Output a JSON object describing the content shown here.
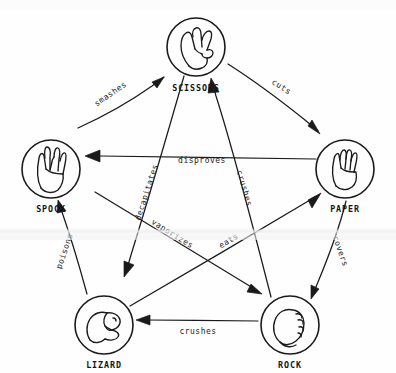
{
  "diagram": {
    "style": "hand-drawn sketch, black ink on white paper",
    "background_color": "#fefefe",
    "ink_color": "#1a1a1a",
    "layout": "pentagon with inner pentagram of arrows",
    "nodes": [
      {
        "id": "scissors",
        "label": "SCISSORS",
        "icon": "hand-scissors-icon",
        "cx": 196,
        "cy": 47,
        "r": 29,
        "label_x": 196,
        "label_y": 91
      },
      {
        "id": "paper",
        "label": "PAPER",
        "icon": "hand-flat-paper-icon",
        "cx": 345,
        "cy": 169,
        "r": 29,
        "label_x": 345,
        "label_y": 212
      },
      {
        "id": "rock",
        "label": "ROCK",
        "icon": "hand-fist-rock-icon",
        "cx": 290,
        "cy": 325,
        "r": 29,
        "label_x": 290,
        "label_y": 368
      },
      {
        "id": "lizard",
        "label": "LIZARD",
        "icon": "hand-lizard-sockpuppet-icon",
        "cx": 104,
        "cy": 325,
        "r": 29,
        "label_x": 104,
        "label_y": 368
      },
      {
        "id": "spock",
        "label": "SPOCK",
        "icon": "hand-vulcan-salute-icon",
        "cx": 51,
        "cy": 169,
        "r": 29,
        "label_x": 51,
        "label_y": 212
      }
    ],
    "edges": [
      {
        "id": "spock-smashes-scissors",
        "from": "spock",
        "to": "scissors",
        "verb": "smashes",
        "x1": 78,
        "y1": 128,
        "x2": 164,
        "y2": 67,
        "label_x": 112,
        "label_y": 96,
        "label_rotate": -35
      },
      {
        "id": "scissors-cuts-paper",
        "from": "scissors",
        "to": "paper",
        "verb": "cuts",
        "x1": 228,
        "y1": 67,
        "x2": 320,
        "y2": 130,
        "label_x": 280,
        "label_y": 89,
        "label_rotate": 33
      },
      {
        "id": "paper-covers-rock",
        "from": "paper",
        "to": "rock",
        "verb": "covers",
        "x1": 345,
        "y1": 200,
        "x2": 312,
        "y2": 288,
        "label_x": 337,
        "label_y": 252,
        "label_rotate": 70
      },
      {
        "id": "rock-crushes-lizard",
        "from": "rock",
        "to": "lizard",
        "verb": "crushes",
        "x1": 258,
        "y1": 322,
        "x2": 139,
        "y2": 322,
        "label_x": 198,
        "label_y": 333,
        "label_rotate": 0
      },
      {
        "id": "lizard-poisons-spock",
        "from": "lizard",
        "to": "spock",
        "verb": "poisons",
        "x1": 88,
        "y1": 292,
        "x2": 58,
        "y2": 203,
        "label_x": 66,
        "label_y": 251,
        "label_rotate": -71
      },
      {
        "id": "paper-disproves-spock",
        "from": "paper",
        "to": "spock",
        "verb": "disproves",
        "x1": 313,
        "y1": 159,
        "x2": 85,
        "y2": 156,
        "label_x": 200,
        "label_y": 163,
        "label_rotate": 0
      },
      {
        "id": "scissors-decapitates-lizard",
        "from": "scissors",
        "to": "lizard",
        "verb": "decapitates",
        "x1": 183,
        "y1": 77,
        "x2": 122,
        "y2": 269,
        "label_x": 148,
        "label_y": 193,
        "label_rotate": -72
      },
      {
        "id": "spock-vaporizes-rock",
        "from": "spock",
        "to": "rock",
        "verb": "vaporizes",
        "x1": 96,
        "y1": 192,
        "x2": 259,
        "y2": 292,
        "label_x": 170,
        "label_y": 235,
        "label_rotate": 32
      },
      {
        "id": "rock-crushes-scissors",
        "from": "rock",
        "to": "scissors",
        "verb": "crushes",
        "x1": 270,
        "y1": 296,
        "x2": 211,
        "y2": 84,
        "label_x": 241,
        "label_y": 189,
        "label_rotate": 74
      },
      {
        "id": "lizard-eats-paper",
        "from": "lizard",
        "to": "paper",
        "verb": "eats",
        "x1": 131,
        "y1": 305,
        "x2": 318,
        "y2": 194,
        "label_x": 229,
        "label_y": 242,
        "label_rotate": -31
      }
    ]
  }
}
